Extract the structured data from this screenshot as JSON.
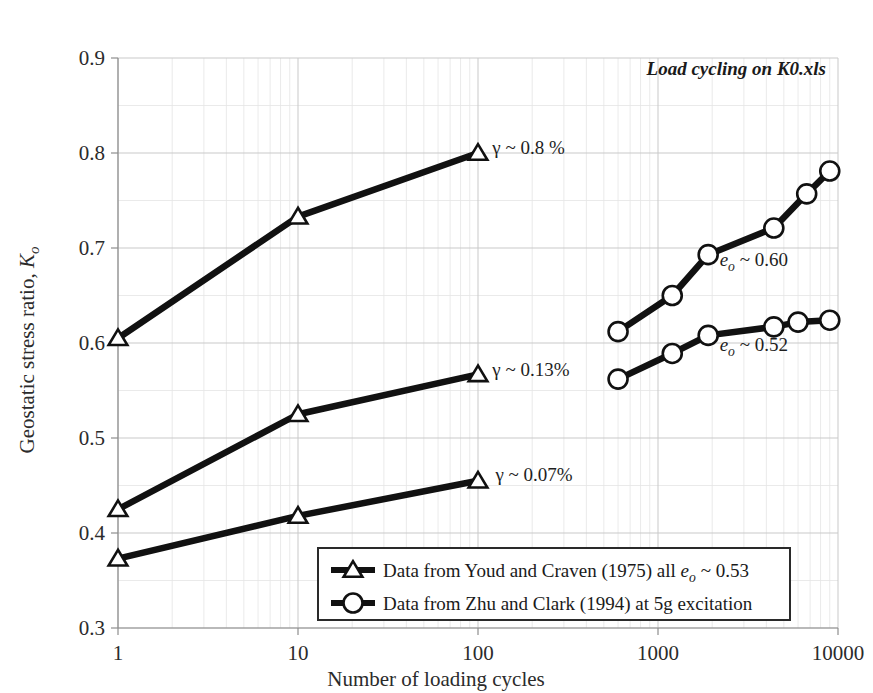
{
  "figure": {
    "annotation_title": "Load cycling on K0.xls",
    "background_color": "#ffffff",
    "line_color": "#111111",
    "grid_color": "#c9c9c9"
  },
  "chart_data": {
    "type": "line",
    "title": "Load cycling on K0.xls",
    "xlabel": "Number of loading cycles",
    "ylabel": "Geostatic stress ratio, Kₒ",
    "ylabel_text": "Geostatic stress ratio, ",
    "ylabel_symbol": "K",
    "ylabel_symbol_sub": "o",
    "xscale": "log",
    "yscale": "linear",
    "xlim": [
      1,
      10000
    ],
    "ylim": [
      0.3,
      0.9
    ],
    "grid": true,
    "legend_position": "lower-center-right",
    "xticks": [
      1,
      10,
      100,
      1000,
      10000
    ],
    "xtick_labels": [
      "1",
      "10",
      "100",
      "1000",
      "10000"
    ],
    "yticks": [
      0.3,
      0.4,
      0.5,
      0.6,
      0.7,
      0.8,
      0.9
    ],
    "ytick_labels": [
      "0.3",
      "0.4",
      "0.5",
      "0.6",
      "0.7",
      "0.8",
      "0.9"
    ],
    "series": [
      {
        "name": "Youd and Craven (1975), gamma ~ 0.8 %",
        "marker": "triangle",
        "x": [
          1,
          10,
          100
        ],
        "values": [
          0.605,
          0.733,
          0.8
        ]
      },
      {
        "name": "Youd and Craven (1975), gamma ~ 0.13%",
        "marker": "triangle",
        "x": [
          1,
          10,
          100
        ],
        "values": [
          0.425,
          0.525,
          0.567
        ]
      },
      {
        "name": "Youd and Craven (1975), gamma ~ 0.07%",
        "marker": "triangle",
        "x": [
          1,
          10,
          100
        ],
        "values": [
          0.373,
          0.418,
          0.455
        ]
      },
      {
        "name": "Zhu and Clark (1994), e_o ~ 0.60",
        "marker": "circle",
        "x": [
          600,
          1200,
          1900,
          4400,
          6700,
          9000
        ],
        "values": [
          0.612,
          0.65,
          0.693,
          0.721,
          0.757,
          0.781
        ]
      },
      {
        "name": "Zhu and Clark (1994), e_o ~ 0.52",
        "marker": "circle",
        "x": [
          600,
          1200,
          1900,
          4400,
          6000,
          9000
        ],
        "values": [
          0.562,
          0.589,
          0.608,
          0.617,
          0.622,
          0.624
        ]
      }
    ],
    "annotations": [
      {
        "name": "gamma-0-8",
        "text": "γ ~ 0.8 %",
        "x": 120,
        "y": 0.805
      },
      {
        "name": "gamma-0-13",
        "text": "γ ~ 0.13%",
        "x": 120,
        "y": 0.572
      },
      {
        "name": "gamma-0-07",
        "text": "γ ~ 0.07%",
        "x": 125,
        "y": 0.461
      },
      {
        "name": "e0-0-60",
        "prefix": "e",
        "sub": "o",
        "suffix": " ~ 0.60",
        "x": 2200,
        "y": 0.687
      },
      {
        "name": "e0-0-52",
        "prefix": "e",
        "sub": "o",
        "suffix": " ~ 0.52",
        "x": 2200,
        "y": 0.598
      }
    ],
    "legend": [
      {
        "marker": "triangle",
        "text_before": "Data from Youd and Craven (1975) all ",
        "symbol": "e",
        "symbol_sub": "o",
        "text_after": " ~ 0.53"
      },
      {
        "marker": "circle",
        "text_before": "Data from Zhu and Clark (1994) at 5g excitation",
        "symbol": "",
        "symbol_sub": "",
        "text_after": ""
      }
    ]
  }
}
